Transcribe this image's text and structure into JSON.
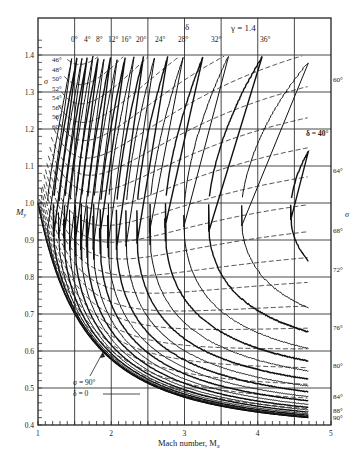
{
  "chart_data": {
    "type": "line",
    "title": "",
    "annotation": "γ = 1.4",
    "xlabel": "Mach number, M_x",
    "ylabel": "M_y",
    "xlim": [
      1,
      5
    ],
    "ylim": [
      0.4,
      1.45
    ],
    "xticks": [
      1,
      2,
      3,
      4,
      5
    ],
    "yticks": [
      0.4,
      0.5,
      0.6,
      0.7,
      0.8,
      0.9,
      1.0,
      1.1,
      1.2,
      1.3,
      1.4
    ],
    "grid": true,
    "series_groups": [
      {
        "name": "δ (deflection angle) — solid curves",
        "symbol": "δ",
        "style": "solid",
        "labels": [
          "0°",
          "4°",
          "8°",
          "12°",
          "16°",
          "20°",
          "24°",
          "28°",
          "32°",
          "36°",
          "δ = 40°"
        ]
      },
      {
        "name": "σ (shock wave angle) — dashed curves",
        "symbol": "σ",
        "style": "dashed",
        "left_labels": [
          "46°",
          "48°",
          "50°",
          "52°",
          "54°",
          "56°",
          "58°",
          "60°"
        ],
        "right_labels": [
          "60°",
          "64°",
          "68°",
          "72°",
          "76°",
          "80°",
          "84°",
          "88°",
          "90°"
        ]
      }
    ],
    "callout": {
      "line1": "σ = 90°",
      "line2": "δ = 0"
    }
  },
  "axis": {
    "x_title": "Mach number, M",
    "x_sub": "x",
    "y_title": "M",
    "y_sub": "y",
    "x_ticks": [
      "1",
      "2",
      "3",
      "4",
      "5"
    ],
    "y_ticks": [
      "0.4",
      "0.5",
      "0.6",
      "0.7",
      "0.8",
      "0.9",
      "1.0",
      "1.1",
      "1.2",
      "1.3",
      "1.4"
    ]
  },
  "header": {
    "gamma": "γ = 1.4",
    "delta_symbol": "δ",
    "delta_labels": [
      "0°",
      "4°",
      "8°",
      "12°",
      "16°",
      "20°",
      "24°",
      "28°",
      "32°",
      "36°"
    ],
    "delta_40": "δ = 40°"
  },
  "sigma": {
    "symbol": "σ",
    "left": [
      "46°",
      "48°",
      "50°",
      "52°",
      "54°",
      "56°",
      "58°",
      "60°"
    ],
    "right": [
      "60°",
      "64°",
      "68°",
      "72°",
      "76°",
      "80°",
      "84°",
      "88°",
      "90°"
    ]
  },
  "callout": {
    "sigma": "σ = 90°",
    "delta": "δ = 0"
  }
}
